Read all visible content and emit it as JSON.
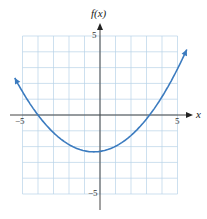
{
  "chart_data": {
    "type": "line",
    "title": "",
    "xlabel": "x",
    "ylabel": "f(x)",
    "xlim": [
      -5,
      5
    ],
    "ylim": [
      -5,
      5
    ],
    "grid": true,
    "x_ticks_labeled": [
      "-5",
      "5"
    ],
    "y_ticks_labeled": [
      "5",
      "-5"
    ],
    "series": [
      {
        "name": "f(x)",
        "description": "upward-opening parabola with arrows at both ends",
        "x": [
          -5.5,
          -5,
          -4,
          -3,
          -2,
          -1,
          -0.4,
          0,
          1,
          2,
          3,
          3.2,
          4,
          5,
          5.6
        ],
        "values": [
          2.4,
          1.6,
          0,
          -1.2,
          -1.9,
          -2.3,
          -2.33,
          -2.3,
          -1.9,
          -1.3,
          -0.2,
          0,
          1.2,
          3.1,
          4.3
        ]
      }
    ],
    "color": "#3b7bbf"
  },
  "labels": {
    "y_axis": "f(x)",
    "x_axis": "x",
    "x_min": "−5",
    "x_max": "5",
    "y_max": "5",
    "y_min": "−5"
  }
}
